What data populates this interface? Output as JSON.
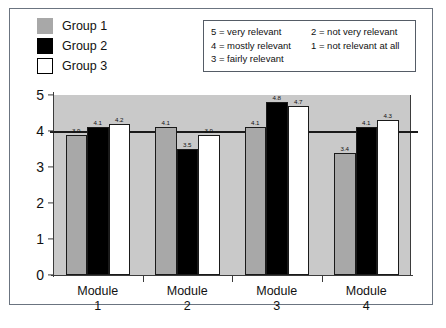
{
  "group_legend": [
    {
      "label": "Group 1",
      "swatch": "g1",
      "color": "#a8a8a8"
    },
    {
      "label": "Group 2",
      "swatch": "g2",
      "color": "#000000"
    },
    {
      "label": "Group 3",
      "swatch": "g3",
      "color": "#ffffff"
    }
  ],
  "scale_key": [
    "5 = very relevant",
    "2 = not very relevant",
    "4 = mostly relevant",
    "1 = not relevant at all",
    "3 = fairly relevant",
    ""
  ],
  "chart_data": {
    "type": "bar",
    "title": "",
    "xlabel": "",
    "ylabel": "",
    "categories": [
      "Module\n1",
      "Module\n2",
      "Module\n3",
      "Module\n4"
    ],
    "category_lines": [
      [
        "Module",
        "1"
      ],
      [
        "Module",
        "2"
      ],
      [
        "Module",
        "3"
      ],
      [
        "Module",
        "4"
      ]
    ],
    "series": [
      {
        "name": "Group 1",
        "values": [
          3.9,
          4.1,
          4.1,
          3.4
        ]
      },
      {
        "name": "Group 2",
        "values": [
          4.1,
          3.5,
          4.8,
          4.1
        ]
      },
      {
        "name": "Group 3",
        "values": [
          4.2,
          3.9,
          4.7,
          4.3
        ]
      }
    ],
    "ylim": [
      0,
      5
    ],
    "yticks": [
      0,
      1,
      2,
      3,
      4,
      5
    ],
    "grid": false,
    "legend_position": "top-left",
    "reference_line": 4,
    "plot_background": "#c9c9c9"
  }
}
